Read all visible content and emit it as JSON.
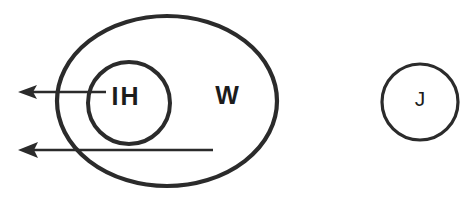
{
  "diagram": {
    "background_color": "#ffffff",
    "stroke_color": "#2b2b2b",
    "text_color": "#1c1c1c",
    "shapes": [
      {
        "id": "outer-ellipse-w",
        "kind": "ellipse",
        "label": "W",
        "cx": 167,
        "cy": 101,
        "rx": 110,
        "ry": 85,
        "stroke_width": 4.2,
        "label_x": 227,
        "label_y": 97
      },
      {
        "id": "inner-circle-ih",
        "kind": "circle",
        "label": "IH",
        "cx": 129,
        "cy": 103,
        "r": 41,
        "stroke_width": 4.0,
        "label_x": 126,
        "label_y": 98
      },
      {
        "id": "separate-circle-j",
        "kind": "circle",
        "label": "J",
        "cx": 420,
        "cy": 102,
        "r": 38,
        "stroke_width": 3.2,
        "label_x": 420,
        "label_y": 100
      }
    ],
    "arrows": [
      {
        "id": "arrow-from-ih",
        "direction": "left",
        "from_x": 106,
        "to_x": 18,
        "y": 92,
        "source_label": "IH"
      },
      {
        "id": "arrow-from-w",
        "direction": "left",
        "from_x": 213,
        "to_x": 18,
        "y": 150,
        "source_label": "W"
      }
    ],
    "labels": {
      "outer": "W",
      "inner": "IH",
      "separate": "J"
    }
  }
}
